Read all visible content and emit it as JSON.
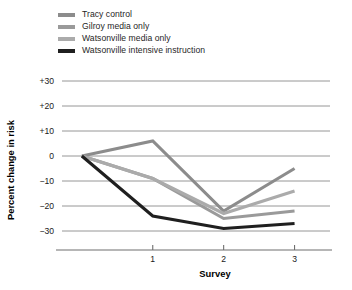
{
  "chart_data": {
    "type": "line",
    "title": "",
    "xlabel": "Survey",
    "ylabel": "Percent change in risk",
    "x": [
      0,
      1,
      2,
      3
    ],
    "xtick_values": [
      1,
      2,
      3
    ],
    "xtick_labels": [
      "1",
      "2",
      "3"
    ],
    "ytick_labels": [
      "+30",
      "+20",
      "+10",
      "0",
      "−10",
      "−20",
      "−30"
    ],
    "ytick_values": [
      30,
      20,
      10,
      0,
      -10,
      -20,
      -30
    ],
    "ylim": [
      -36,
      32
    ],
    "xlim": [
      -0.28,
      3.5
    ],
    "grid": "horizontal",
    "legend_position": "top-left",
    "series": [
      {
        "name": "Tracy control",
        "color": "#8c8c8c",
        "values": [
          0,
          6,
          -22,
          -5
        ]
      },
      {
        "name": "Gilroy media only",
        "color": "#9a9a9a",
        "values": [
          0,
          -9,
          -25,
          -22
        ]
      },
      {
        "name": "Watsonville media only",
        "color": "#ababab",
        "values": [
          0,
          -9,
          -23,
          -14
        ]
      },
      {
        "name": "Watsonville intensive instruction",
        "color": "#1f1f1f",
        "values": [
          0,
          -24,
          -29,
          -27
        ]
      }
    ]
  },
  "legend": {
    "items": [
      {
        "label": "Tracy control",
        "color": "#8c8c8c"
      },
      {
        "label": "Gilroy media only",
        "color": "#9a9a9a"
      },
      {
        "label": "Watsonville media only",
        "color": "#ababab"
      },
      {
        "label": "Watsonville intensive instruction",
        "color": "#1f1f1f"
      }
    ]
  },
  "axes": {
    "x_title": "Survey",
    "y_title": "Percent change in risk"
  },
  "colors": {
    "background": "#ffffff",
    "gridline": "#8a8a8a",
    "axis": "#6f6f6f",
    "text": "#1a1a1a"
  }
}
